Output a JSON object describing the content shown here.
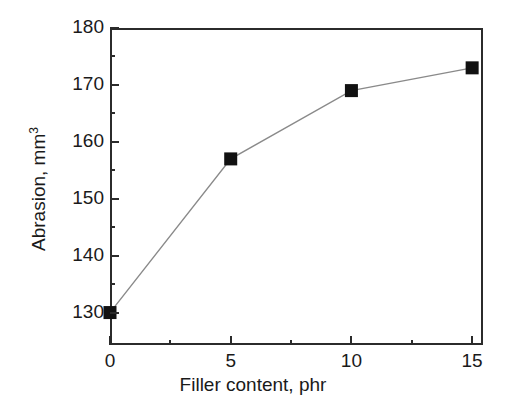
{
  "chart_data": {
    "type": "line",
    "title": "",
    "xlabel": "Filler content, phr",
    "ylabel_text": "Abrasion, mm",
    "ylabel_sup": "3",
    "ylabel_full": "Abrasion, mm3",
    "x": [
      0,
      5,
      10,
      15
    ],
    "values": [
      130,
      157,
      169,
      173
    ],
    "series": [
      {
        "name": "Abrasion",
        "x": [
          0,
          5,
          10,
          15
        ],
        "values": [
          130,
          157,
          169,
          173
        ],
        "marker": "filled-square",
        "marker_color": "#111111",
        "line_color": "#8a8a8a"
      }
    ],
    "xlim": [
      0,
      15.45
    ],
    "ylim": [
      124.3,
      180
    ],
    "xticks": [
      0,
      5,
      10,
      15
    ],
    "xtick_labels": [
      "0",
      "5",
      "10",
      "15"
    ],
    "xminor_ticks": [
      2.5,
      7.5,
      12.5
    ],
    "yticks": [
      130,
      140,
      150,
      160,
      170,
      180
    ],
    "ytick_labels": [
      "130",
      "140",
      "150",
      "160",
      "170",
      "180"
    ],
    "yminor_ticks": [
      135,
      145,
      155,
      165,
      175
    ],
    "grid": false,
    "legend": null,
    "legend_position": "none",
    "tick_direction": "in",
    "frame": "full-box",
    "background_color": "#ffffff",
    "axis_color": "#2b2b2b",
    "text_color": "#1a1a1a"
  }
}
